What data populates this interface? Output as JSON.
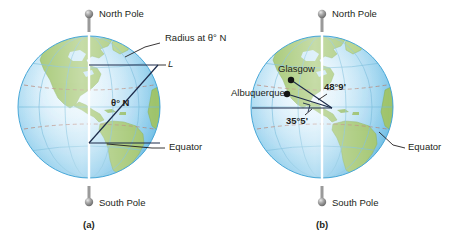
{
  "figure": {
    "background_color": "#ffffff",
    "panels": [
      {
        "caption": "(a)",
        "globe": {
          "center_x": 89,
          "center_y": 107,
          "radius": 71,
          "ocean_edge_color": "#79c3e8",
          "ocean_light_color": "#d7eef9",
          "land_color": "#9ec36a",
          "land_dark_color": "#7faa4e",
          "graticule_color": "#6fb7d8",
          "tropic_color": "#b07a6a"
        },
        "labels": {
          "north_pole": "North Pole",
          "south_pole": "South Pole",
          "equator": "Equator",
          "radius_at": "Radius at θ° N",
          "arc_length": "L",
          "angle": "θ° N"
        }
      },
      {
        "caption": "(b)",
        "globe": {
          "center_x": 322,
          "center_y": 107,
          "radius": 71,
          "ocean_edge_color": "#79c3e8",
          "ocean_light_color": "#d7eef9",
          "land_color": "#9ec36a",
          "land_dark_color": "#7faa4e",
          "graticule_color": "#6fb7d8",
          "tropic_color": "#b07a6a"
        },
        "labels": {
          "north_pole": "North Pole",
          "south_pole": "South Pole",
          "equator": "Equator",
          "city_glasgow": "Glasgow",
          "city_albuquerque": "Albuquerque",
          "angle_glasgow": "48°9'",
          "angle_albuquerque": "35°5'"
        }
      }
    ],
    "leader_line_color": "#231f20",
    "axis_color": "#ffffff",
    "pin_color": "#8c8c8c"
  }
}
